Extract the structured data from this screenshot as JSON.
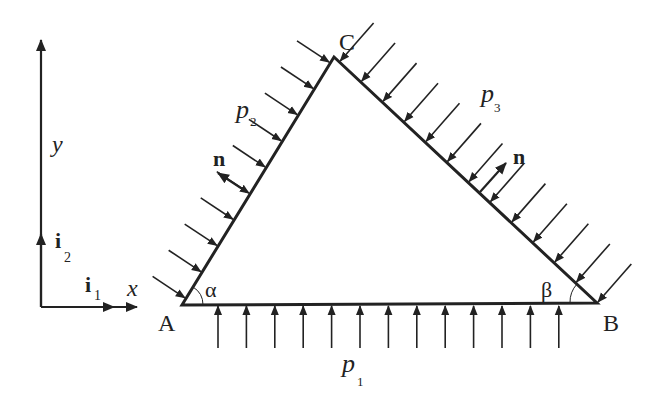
{
  "diagram": {
    "type": "triangle-load-diagram",
    "stroke_color": "#222222",
    "background": "#ffffff",
    "vertices": {
      "A": {
        "label": "A",
        "x": 182,
        "y": 305
      },
      "B": {
        "label": "B",
        "x": 597,
        "y": 303
      },
      "C": {
        "label": "C",
        "x": 334,
        "y": 57
      }
    },
    "angles": {
      "alpha": {
        "label": "α",
        "at": "A"
      },
      "beta": {
        "label": "β",
        "at": "B"
      }
    },
    "loads": {
      "p1": {
        "symbol": "p",
        "subscript": "1",
        "edge": "AB",
        "arrow_count": 13,
        "direction": "up"
      },
      "p2": {
        "symbol": "p",
        "subscript": "2",
        "edge": "AC",
        "arrow_count": 10,
        "direction": "inward"
      },
      "p3": {
        "symbol": "p",
        "subscript": "3",
        "edge": "CB",
        "arrow_count": 13,
        "direction": "inward"
      }
    },
    "normals": {
      "n_left": {
        "label": "n",
        "edge": "AC"
      },
      "n_right": {
        "label": "n",
        "edge": "CB"
      }
    },
    "axes": {
      "x_label": "x",
      "y_label": "y",
      "i1": {
        "symbol": "i",
        "subscript": "1"
      },
      "i2": {
        "symbol": "i",
        "subscript": "2"
      }
    }
  }
}
